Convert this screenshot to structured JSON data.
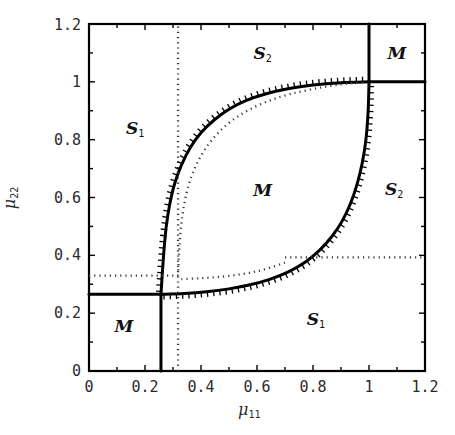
{
  "figure": {
    "background_color": "#ffffff",
    "line_color": "#000000",
    "dotted_color": "#3a3a3a"
  },
  "axes": {
    "x_title": "μ",
    "x_title_sub": "11",
    "y_title": "μ",
    "y_title_sub": "22",
    "x_tick_labels": [
      "0",
      "0.2",
      "0.4",
      "0.6",
      "0.8",
      "1",
      "1.2"
    ],
    "x_tick_values": [
      0,
      0.2,
      0.4,
      0.6,
      0.8,
      1,
      1.2
    ],
    "y_tick_labels": [
      "0",
      "0.2",
      "0.4",
      "0.6",
      "0.8",
      "1",
      "1.2"
    ],
    "y_tick_values": [
      0,
      0.2,
      0.4,
      0.6,
      0.8,
      1,
      1.2
    ],
    "minor_tick_step": 0.1,
    "xlim": [
      0,
      1.2
    ],
    "ylim": [
      0,
      1.2
    ]
  },
  "region_labels": [
    {
      "text": "S",
      "sub": "2",
      "x": 0.62,
      "y": 1.1
    },
    {
      "text": "M",
      "sub": "",
      "x": 1.1,
      "y": 1.1
    },
    {
      "text": "S",
      "sub": "1",
      "x": 0.165,
      "y": 0.84
    },
    {
      "text": "M",
      "sub": "",
      "x": 0.62,
      "y": 0.625
    },
    {
      "text": "S",
      "sub": "2",
      "x": 1.09,
      "y": 0.63
    },
    {
      "text": "S",
      "sub": "1",
      "x": 0.81,
      "y": 0.18
    },
    {
      "text": "M",
      "sub": "",
      "x": 0.125,
      "y": 0.155
    }
  ],
  "chart_data": {
    "type": "line",
    "title": "",
    "xlabel": "μ11",
    "ylabel": "μ22",
    "xlim": [
      0,
      1.2
    ],
    "ylim": [
      0,
      1.2
    ],
    "grid": false,
    "legend": "none",
    "series": [
      {
        "name": "upper-boundary-solid",
        "style": "solid",
        "hatched": true,
        "hatch_side": "above",
        "points": [
          [
            0.257,
            0.265
          ],
          [
            0.262,
            0.34
          ],
          [
            0.268,
            0.42
          ],
          [
            0.276,
            0.5
          ],
          [
            0.288,
            0.575
          ],
          [
            0.305,
            0.645
          ],
          [
            0.33,
            0.712
          ],
          [
            0.362,
            0.773
          ],
          [
            0.4,
            0.824
          ],
          [
            0.447,
            0.868
          ],
          [
            0.5,
            0.905
          ],
          [
            0.56,
            0.935
          ],
          [
            0.63,
            0.958
          ],
          [
            0.71,
            0.976
          ],
          [
            0.8,
            0.989
          ],
          [
            0.9,
            0.997
          ],
          [
            1.0,
            1.0
          ]
        ]
      },
      {
        "name": "lower-boundary-solid",
        "style": "solid",
        "hatched": true,
        "hatch_side": "below",
        "points": [
          [
            0.257,
            0.265
          ],
          [
            0.34,
            0.268
          ],
          [
            0.42,
            0.274
          ],
          [
            0.5,
            0.284
          ],
          [
            0.575,
            0.298
          ],
          [
            0.645,
            0.317
          ],
          [
            0.712,
            0.343
          ],
          [
            0.773,
            0.377
          ],
          [
            0.824,
            0.418
          ],
          [
            0.868,
            0.466
          ],
          [
            0.905,
            0.52
          ],
          [
            0.935,
            0.582
          ],
          [
            0.958,
            0.648
          ],
          [
            0.976,
            0.72
          ],
          [
            0.989,
            0.8
          ],
          [
            0.997,
            0.9
          ],
          [
            1.0,
            1.0
          ]
        ]
      },
      {
        "name": "left-vertical-solid",
        "style": "solid",
        "points": [
          [
            0.257,
            0.0
          ],
          [
            0.257,
            0.265
          ]
        ]
      },
      {
        "name": "left-horizontal-solid",
        "style": "solid",
        "points": [
          [
            0.0,
            0.265
          ],
          [
            0.257,
            0.265
          ]
        ]
      },
      {
        "name": "top-vertical-solid",
        "style": "solid",
        "points": [
          [
            1.0,
            1.0
          ],
          [
            1.0,
            1.2
          ]
        ]
      },
      {
        "name": "right-horizontal-solid",
        "style": "solid",
        "points": [
          [
            1.0,
            1.0
          ],
          [
            1.2,
            1.0
          ]
        ]
      },
      {
        "name": "dotted-upper-curve",
        "style": "dotted",
        "points": [
          [
            0.318,
            0.33
          ],
          [
            0.321,
            0.4
          ],
          [
            0.326,
            0.47
          ],
          [
            0.334,
            0.54
          ],
          [
            0.346,
            0.605
          ],
          [
            0.364,
            0.668
          ],
          [
            0.39,
            0.726
          ],
          [
            0.424,
            0.78
          ],
          [
            0.466,
            0.828
          ],
          [
            0.516,
            0.87
          ],
          [
            0.575,
            0.905
          ],
          [
            0.642,
            0.934
          ],
          [
            0.716,
            0.957
          ],
          [
            0.8,
            0.975
          ],
          [
            0.89,
            0.99
          ],
          [
            0.985,
            1.0
          ]
        ]
      },
      {
        "name": "dotted-vertical-left",
        "style": "dotted",
        "points": [
          [
            0.318,
            0.0
          ],
          [
            0.318,
            1.2
          ]
        ]
      },
      {
        "name": "dotted-horizontal-left",
        "style": "dotted",
        "points": [
          [
            0.0,
            0.33
          ],
          [
            0.318,
            0.33
          ]
        ]
      },
      {
        "name": "dotted-lower-curve",
        "style": "dotted",
        "points": [
          [
            0.33,
            0.318
          ],
          [
            0.4,
            0.321
          ],
          [
            0.47,
            0.326
          ],
          [
            0.54,
            0.334
          ],
          [
            0.605,
            0.346
          ],
          [
            0.668,
            0.364
          ],
          [
            0.7,
            0.375
          ]
        ]
      },
      {
        "name": "dotted-horizontal-right",
        "style": "dotted",
        "points": [
          [
            0.7,
            0.393
          ],
          [
            1.2,
            0.393
          ]
        ]
      }
    ]
  }
}
